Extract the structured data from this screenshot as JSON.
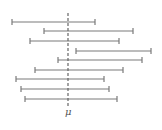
{
  "diagram": {
    "title": "",
    "mean_label": "μ",
    "mean_x": 68,
    "mean_line": {
      "y1": 13,
      "y2": 106,
      "style": "dashed"
    },
    "line_color": "#7a7a7a",
    "intervals": [
      {
        "left": 12,
        "right": 95,
        "y": 22
      },
      {
        "left": 44,
        "right": 133,
        "y": 31
      },
      {
        "left": 30,
        "right": 119,
        "y": 41
      },
      {
        "left": 76,
        "right": 151,
        "y": 51
      },
      {
        "left": 58,
        "right": 142,
        "y": 60
      },
      {
        "left": 35,
        "right": 123,
        "y": 70
      },
      {
        "left": 16,
        "right": 104,
        "y": 79
      },
      {
        "left": 21,
        "right": 109,
        "y": 89
      },
      {
        "left": 25,
        "right": 117,
        "y": 99
      }
    ]
  }
}
